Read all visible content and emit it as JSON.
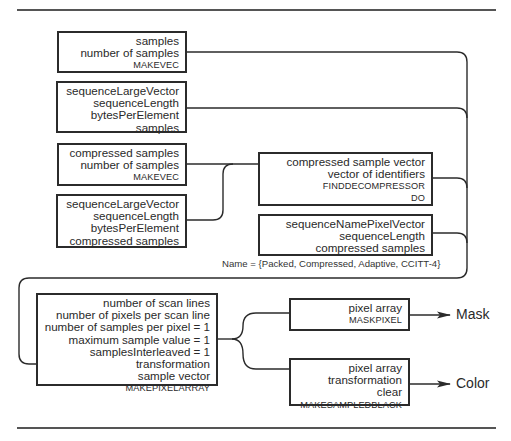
{
  "diagram": {
    "boxes": [
      {
        "id": "makevec-samples",
        "lines": [
          "samples",
          "number of samples"
        ],
        "operator": "MAKEVEC"
      },
      {
        "id": "sequence-large-vector-samples",
        "lines": [
          "sequenceLargeVector",
          "sequenceLength",
          "bytesPerElement",
          "samples"
        ],
        "operator": ""
      },
      {
        "id": "makevec-compressed",
        "lines": [
          "compressed samples",
          "number of samples"
        ],
        "operator": "MAKEVEC"
      },
      {
        "id": "sequence-large-vector-compressed",
        "lines": [
          "sequenceLargeVector",
          "sequenceLength",
          "bytesPerElement",
          "compressed samples"
        ],
        "operator": ""
      },
      {
        "id": "find-decompressor",
        "lines": [
          "compressed sample vector",
          "vector of identifiers"
        ],
        "operators": [
          "FINDDECOMPRESSOR",
          "DO"
        ]
      },
      {
        "id": "sequence-name-pixel-vector",
        "lines": [
          "sequenceNamePixelVector",
          "sequenceLength",
          "compressed samples"
        ],
        "operator": ""
      },
      {
        "id": "make-pixel-array",
        "lines": [
          "number of scan lines",
          "number of pixels per scan line",
          "number of samples per pixel = 1",
          "maximum sample value = 1",
          "samplesInterleaved = 1",
          "transformation",
          "sample vector"
        ],
        "operator": "MAKEPIXELARRAY"
      },
      {
        "id": "mask-pixel",
        "lines": [
          "pixel array"
        ],
        "operator": "MASKPIXEL"
      },
      {
        "id": "make-sampled-black",
        "lines": [
          "pixel array",
          "transformation",
          "clear"
        ],
        "operator": "MAKESAMPLEDBLACK"
      }
    ],
    "note": "Name = {Packed, Compressed, Adaptive, CCITT-4}",
    "outputs": {
      "mask": "Mask",
      "color": "Color"
    },
    "colors": {
      "line": "#2b2b2b",
      "rule": "#555555",
      "background": "#ffffff"
    }
  }
}
